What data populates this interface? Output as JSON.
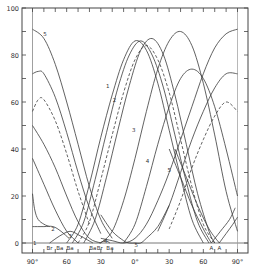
{
  "chart_data": {
    "type": "line",
    "title": "",
    "xlabel": "",
    "ylabel": "",
    "xlim": [
      -90,
      90
    ],
    "ylim": [
      0,
      100
    ],
    "grid": false,
    "x_tick_labels": [
      "90°",
      "60",
      "30",
      "0°",
      "30",
      "60",
      "90°"
    ],
    "x_tick_values": [
      -90,
      -60,
      -30,
      0,
      30,
      60,
      90
    ],
    "y_tick_labels": [
      "0",
      "20",
      "40",
      "60",
      "80",
      "100"
    ],
    "y_tick_values": [
      0,
      20,
      40,
      60,
      80,
      100
    ],
    "baseline_markers": [
      {
        "label": "Br",
        "x": -75
      },
      {
        "label": "Ba",
        "x": -66
      },
      {
        "label": "Ba",
        "x": -57
      },
      {
        "label": "Ba",
        "x": -37
      },
      {
        "label": "Br",
        "x": -31
      },
      {
        "label": "Ba",
        "x": -22
      },
      {
        "label": "A",
        "x": 67
      },
      {
        "label": "A",
        "x": 74
      }
    ],
    "curve_labels": [
      {
        "label": "5",
        "x": -79,
        "y": 89
      },
      {
        "label": "1",
        "x": -24,
        "y": 67
      },
      {
        "label": "2",
        "x": -18,
        "y": 61
      },
      {
        "label": "3",
        "x": -1,
        "y": 48
      },
      {
        "label": "4",
        "x": 11,
        "y": 35
      },
      {
        "label": "5",
        "x": 30,
        "y": 31
      },
      {
        "label": "1",
        "x": -88,
        "y": 0
      },
      {
        "label": "2",
        "x": -72,
        "y": 6
      },
      {
        "label": "3",
        "x": -57,
        "y": 3
      },
      {
        "label": "4",
        "x": -26,
        "y": 1
      },
      {
        "label": "5",
        "x": 1,
        "y": -1
      }
    ],
    "series": [
      {
        "name": "1 (solid, left arc)",
        "style": "solid",
        "x": [
          -90,
          -80,
          -70,
          -60,
          -50,
          -40,
          -30
        ],
        "y": [
          50,
          42,
          32,
          20,
          9,
          2,
          0
        ]
      },
      {
        "name": "5 (left arc)",
        "style": "solid",
        "x": [
          -90,
          -80,
          -70,
          -60,
          -50,
          -40,
          -30,
          -20
        ],
        "y": [
          91,
          87,
          76,
          60,
          42,
          24,
          10,
          2
        ]
      },
      {
        "name": "upper mid (left arc)",
        "style": "solid",
        "x": [
          -90,
          -85,
          -80,
          -70,
          -60,
          -50,
          -40,
          -30
        ],
        "y": [
          72,
          73,
          72,
          62,
          47,
          30,
          15,
          4
        ]
      },
      {
        "name": "dashed (left arc)",
        "style": "dashed",
        "x": [
          -90,
          -85,
          -80,
          -70,
          -60,
          -50,
          -40
        ],
        "y": [
          56,
          61,
          61,
          52,
          38,
          22,
          8
        ]
      },
      {
        "name": "lower left arc",
        "style": "solid",
        "x": [
          -90,
          -80,
          -70,
          -60,
          -50
        ],
        "y": [
          36,
          25,
          14,
          5,
          0
        ]
      },
      {
        "name": "1 (main peak)",
        "style": "solid",
        "x": [
          -60,
          -50,
          -40,
          -30,
          -20,
          -10,
          0,
          10,
          20,
          30,
          40,
          50,
          60
        ],
        "y": [
          0,
          8,
          25,
          45,
          63,
          78,
          86,
          82,
          68,
          48,
          28,
          10,
          0
        ]
      },
      {
        "name": "2 (main peak)",
        "style": "solid",
        "x": [
          -55,
          -45,
          -35,
          -25,
          -15,
          -5,
          5,
          15,
          25,
          35,
          45,
          55,
          65
        ],
        "y": [
          0,
          9,
          27,
          47,
          66,
          80,
          86,
          80,
          66,
          46,
          26,
          9,
          0
        ]
      },
      {
        "name": "2 dashed (main peak)",
        "style": "dashed",
        "x": [
          -50,
          -40,
          -30,
          -20,
          -10,
          0,
          10,
          20,
          30,
          40,
          50,
          60,
          70
        ],
        "y": [
          0,
          9,
          27,
          46,
          64,
          78,
          84,
          78,
          64,
          44,
          24,
          8,
          0
        ]
      },
      {
        "name": "3 (main peak)",
        "style": "solid",
        "x": [
          -45,
          -35,
          -25,
          -15,
          -5,
          5,
          15,
          25,
          35,
          45,
          55,
          65,
          70
        ],
        "y": [
          0,
          10,
          28,
          48,
          67,
          82,
          87,
          80,
          63,
          42,
          21,
          5,
          0
        ]
      },
      {
        "name": "4 (right arc)",
        "style": "solid",
        "x": [
          -30,
          -20,
          -10,
          0,
          10,
          20,
          30,
          40,
          50,
          60,
          70,
          80,
          90
        ],
        "y": [
          0,
          5,
          18,
          36,
          56,
          74,
          86,
          90,
          84,
          68,
          46,
          22,
          5
        ]
      },
      {
        "name": "right mid arc",
        "style": "solid",
        "x": [
          -10,
          0,
          10,
          20,
          30,
          40,
          50,
          60,
          70,
          80,
          90
        ],
        "y": [
          0,
          8,
          24,
          42,
          58,
          70,
          74,
          70,
          58,
          40,
          20
        ]
      },
      {
        "name": "5 (right rising)",
        "style": "solid",
        "x": [
          -30,
          -20,
          -10,
          0,
          10,
          20,
          30,
          40,
          50,
          60,
          70,
          80,
          90
        ],
        "y": [
          2,
          1,
          0,
          2,
          8,
          18,
          30,
          44,
          58,
          72,
          83,
          89,
          91
        ]
      },
      {
        "name": "right upper",
        "style": "solid",
        "x": [
          20,
          30,
          40,
          50,
          60,
          70,
          80,
          90
        ],
        "y": [
          5,
          16,
          30,
          44,
          56,
          66,
          72,
          72
        ]
      },
      {
        "name": "right dashed",
        "style": "dashed",
        "x": [
          30,
          40,
          50,
          60,
          70,
          80,
          90
        ],
        "y": [
          6,
          18,
          32,
          44,
          54,
          60,
          56
        ]
      },
      {
        "name": "A descending 1",
        "style": "solid",
        "x": [
          30,
          40,
          50,
          60,
          67
        ],
        "y": [
          40,
          28,
          16,
          6,
          0
        ]
      },
      {
        "name": "A descending 2",
        "style": "solid",
        "x": [
          35,
          45,
          55,
          65,
          74
        ],
        "y": [
          40,
          28,
          16,
          6,
          0
        ]
      },
      {
        "name": "A ascending 1",
        "style": "solid",
        "x": [
          67,
          75,
          83,
          88
        ],
        "y": [
          0,
          5,
          10,
          15
        ]
      },
      {
        "name": "A ascending 2",
        "style": "solid",
        "x": [
          74,
          80,
          86,
          90
        ],
        "y": [
          0,
          4,
          8,
          11
        ]
      },
      {
        "name": "1 small (bottom-left)",
        "style": "solid",
        "x": [
          -90,
          -88,
          -85,
          -80,
          -75
        ],
        "y": [
          21,
          14,
          10,
          8,
          7
        ]
      },
      {
        "name": "2 small flat",
        "style": "solid",
        "x": [
          -90,
          -80,
          -72,
          -65,
          -58
        ],
        "y": [
          7,
          7,
          7,
          5,
          2
        ]
      },
      {
        "name": "3 small arc",
        "style": "solid",
        "x": [
          -75,
          -66,
          -57,
          -48,
          -37
        ],
        "y": [
          0,
          3,
          5,
          3,
          0
        ]
      },
      {
        "name": "4 small arc",
        "style": "solid",
        "x": [
          -31,
          -26,
          -22
        ],
        "y": [
          0,
          1,
          0
        ]
      },
      {
        "name": "5 trough",
        "style": "solid",
        "x": [
          -30,
          -20,
          -10,
          -5,
          0,
          5,
          10,
          20,
          30
        ],
        "y": [
          12,
          5,
          1,
          0,
          0,
          0,
          2,
          7,
          16
        ]
      }
    ]
  }
}
